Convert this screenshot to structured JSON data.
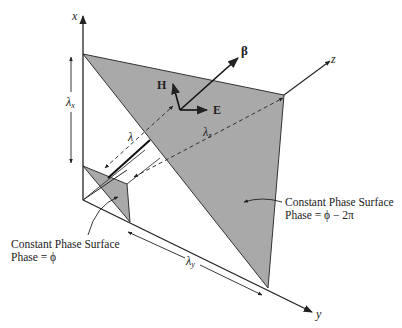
{
  "axes": {
    "x": {
      "label": "x"
    },
    "y": {
      "label": "y"
    },
    "z": {
      "label": "z"
    }
  },
  "vectors": {
    "beta": {
      "label": "β"
    },
    "H": {
      "label": "H"
    },
    "E": {
      "label": "E"
    }
  },
  "wavelengths": {
    "lambda": {
      "label": "λ"
    },
    "lambda_x": {
      "label": "λ",
      "sub": "x"
    },
    "lambda_y": {
      "label": "λ",
      "sub": "y"
    },
    "lambda_z": {
      "label": "λ",
      "sub": "z"
    }
  },
  "surfaces": {
    "front": {
      "title": "Constant Phase Surface",
      "phase": "Phase = ϕ − 2π"
    },
    "back": {
      "title": "Constant Phase Surface",
      "phase": "Phase = ϕ"
    }
  },
  "colors": {
    "surface_fill": "#a9a9a9",
    "line": "#222222",
    "background": "#ffffff"
  }
}
